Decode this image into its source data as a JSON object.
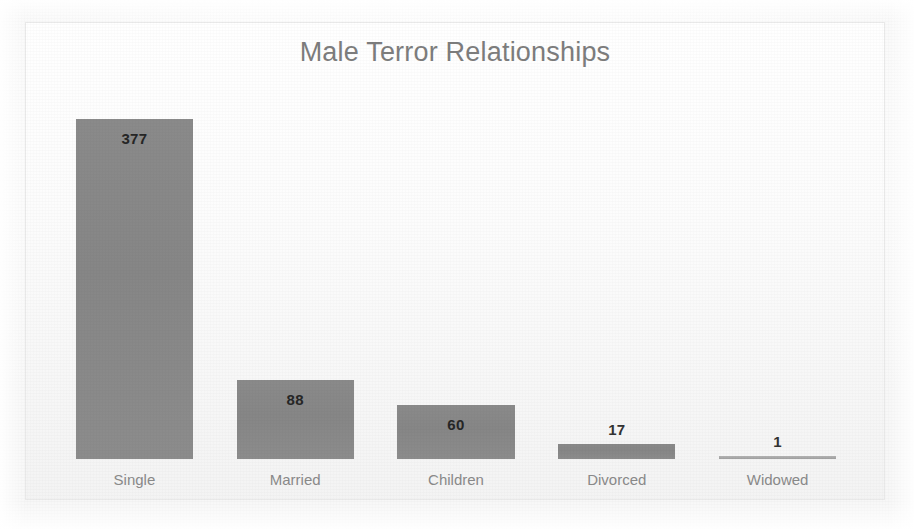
{
  "chart_data": {
    "type": "bar",
    "title": "Male Terror Relationships",
    "xlabel": "",
    "ylabel": "",
    "categories": [
      "Single",
      "Married",
      "Children",
      "Divorced",
      "Widowed"
    ],
    "values": [
      377,
      88,
      60,
      17,
      1
    ],
    "value_labels": [
      "377",
      "88",
      "60",
      "17",
      "1"
    ],
    "label_positions": [
      "inside",
      "inside",
      "inside",
      "outside",
      "outside"
    ],
    "ylim": [
      0,
      400
    ],
    "grid": false,
    "legend": null,
    "orientation": "vertical",
    "bar_color": "#878787",
    "title_color": "#7d7d7d",
    "axis_label_color": "#8a8a8a",
    "value_label_color": "#2e2e2e",
    "background_color": "#fdfdfd",
    "border_color": "#e9e9e9"
  }
}
